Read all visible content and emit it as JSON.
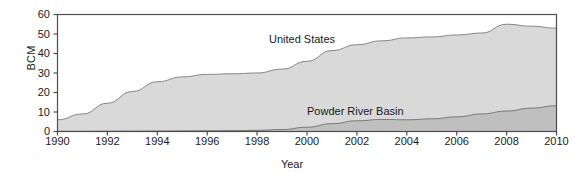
{
  "chart_data": {
    "type": "area",
    "title": "",
    "xlabel": "Year",
    "ylabel": "BCM",
    "xlim": [
      1990,
      2010
    ],
    "ylim": [
      0,
      60
    ],
    "grid": false,
    "legend_position": "inline-annotation",
    "x": [
      1990,
      1991,
      1992,
      1993,
      1994,
      1995,
      1996,
      1997,
      1998,
      1999,
      2000,
      2001,
      2002,
      2003,
      2004,
      2005,
      2006,
      2007,
      2008,
      2009,
      2010
    ],
    "series": [
      {
        "name": "United States",
        "values": [
          6.0,
          9.0,
          14.5,
          20.5,
          25.5,
          28.0,
          29.3,
          29.6,
          30.0,
          32.0,
          36.0,
          41.5,
          44.5,
          46.5,
          48.0,
          48.5,
          49.5,
          50.5,
          55.0,
          54.0,
          53.0
        ],
        "fill_color": "#d9d9d9",
        "line_color": "#7a7a7a"
      },
      {
        "name": "Powder River Basin",
        "values": [
          0.1,
          0.1,
          0.15,
          0.2,
          0.25,
          0.3,
          0.35,
          0.45,
          0.6,
          1.0,
          2.2,
          4.0,
          5.5,
          6.2,
          6.0,
          6.5,
          7.5,
          9.0,
          10.5,
          12.0,
          13.2
        ],
        "fill_color": "#bfbfbf",
        "line_color": "#6e6e6e"
      }
    ],
    "yticks": [
      {
        "value": 0,
        "label": "0"
      },
      {
        "value": 10,
        "label": "10"
      },
      {
        "value": 20,
        "label": "20"
      },
      {
        "value": 30,
        "label": "30"
      },
      {
        "value": 40,
        "label": "40"
      },
      {
        "value": 50,
        "label": "50"
      },
      {
        "value": 60,
        "label": "60"
      }
    ],
    "xticks": [
      {
        "value": 1990,
        "label": "1990"
      },
      {
        "value": 1992,
        "label": "1992"
      },
      {
        "value": 1994,
        "label": "1994"
      },
      {
        "value": 1996,
        "label": "1996"
      },
      {
        "value": 1998,
        "label": "1998"
      },
      {
        "value": 2000,
        "label": "2000"
      },
      {
        "value": 2002,
        "label": "2002"
      },
      {
        "value": 2004,
        "label": "2004"
      },
      {
        "value": 2006,
        "label": "2006"
      },
      {
        "value": 2008,
        "label": "2008"
      },
      {
        "value": 2010,
        "label": "2010"
      }
    ],
    "annotations": [
      {
        "text": "United States",
        "x": 2000,
        "y": 52
      },
      {
        "text": "Powder River Basin",
        "x": 2002,
        "y": 17
      }
    ],
    "colors": {
      "axis": "#4d4d4d",
      "background": "#ffffff",
      "text": "#1a1a1a",
      "us_fill": "#d9d9d9",
      "prb_fill": "#bfbfbf"
    }
  },
  "axis_titles": {
    "x": "Year",
    "y": "BCM"
  }
}
